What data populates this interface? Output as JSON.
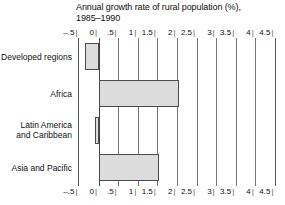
{
  "chart_data": {
    "type": "bar",
    "orientation": "horizontal",
    "title": "Annual growth rate of rural population (%),",
    "title_line2": "1985–1990",
    "xlabel": "",
    "ylabel": "",
    "xlim": [
      -0.5,
      4.5
    ],
    "grid": true,
    "legend": "none",
    "categories": [
      "Developed regions",
      "Africa",
      "Latin America and Caribbean",
      "Asia and Pacific"
    ],
    "category_lines": [
      [
        "Developed regions"
      ],
      [
        "Africa"
      ],
      [
        "Latin America",
        "and Caribbean"
      ],
      [
        "Asia and Pacific"
      ]
    ],
    "values": [
      -0.35,
      2.05,
      -0.1,
      1.55
    ],
    "tick_values": [
      -0.5,
      0,
      0.5,
      1,
      1.5,
      2,
      2.5,
      3,
      3.5,
      4,
      4.5
    ],
    "tick_labels": [
      "–.5",
      "0",
      ".5",
      "1",
      "1.5",
      "2",
      "2.5",
      "3",
      "3.5",
      "4",
      "4.5"
    ],
    "tick_mark": "|",
    "bar_fill_color": "#dcdcdc",
    "bar_border_color": "#4a4a4a",
    "gridline_color": "#777777",
    "background_color": "#ffffff",
    "text_color": "#111111"
  }
}
